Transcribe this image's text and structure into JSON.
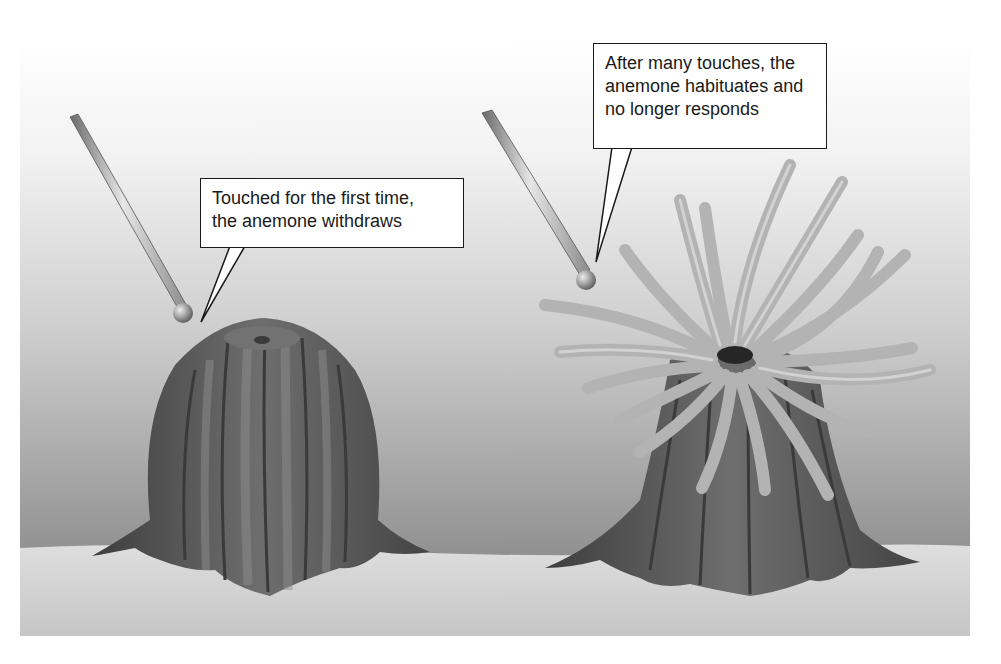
{
  "figure": {
    "panels": [
      {
        "id": "first-touch",
        "callout": "Touched for the first time,\nthe anemone withdraws",
        "state": "withdrawn"
      },
      {
        "id": "habituated",
        "callout": "After many touches, the\nanemone habituates and\nno longer responds",
        "state": "tentacles-extended"
      }
    ],
    "colors": {
      "background_top": "#ffffff",
      "background_water": "#9a9a9a",
      "sand": "#d4d4d4",
      "anemone_body": "#5e5e5e",
      "tentacles": "#b5b5b5",
      "callout_border": "#1a1a1a"
    }
  }
}
